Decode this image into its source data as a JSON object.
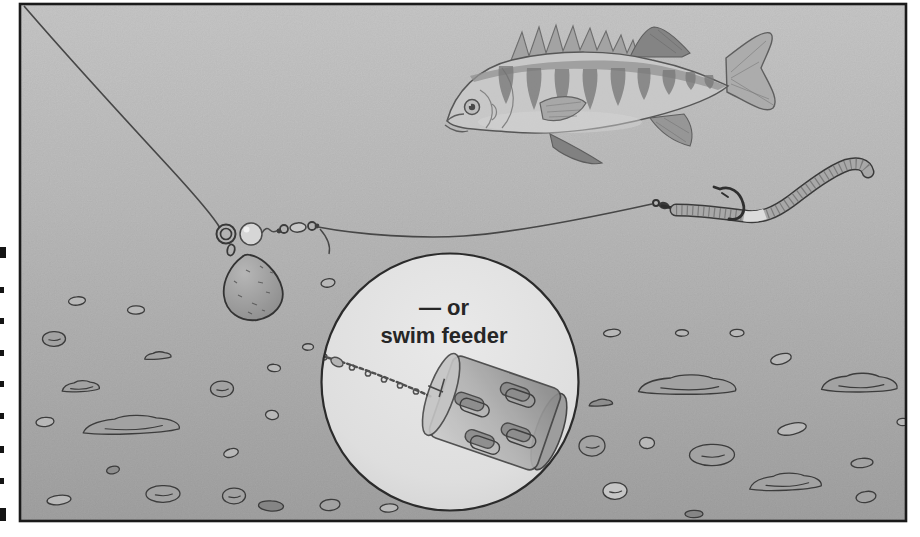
{
  "inset": {
    "label_line1": "— or",
    "label_line2": "swim feeder"
  },
  "scene": {
    "elements": [
      "fishing-line",
      "stop-ring",
      "bead",
      "barrel-swivel",
      "ledger-weight",
      "tag-end",
      "hook",
      "worm-bait",
      "perch-fish",
      "link-chain",
      "swim-feeder",
      "lake-bed-stones",
      "page-margin-marks"
    ]
  },
  "colors": {
    "page": "#ffffff",
    "background_top": "#cbcbcb",
    "background_mid": "#bdbdbd",
    "background_bottom": "#a5a5a5",
    "frame_border": "#1a1a1a",
    "inset_fill_center": "#e9e9e9",
    "inset_fill_edge": "#d0d0d0",
    "inset_stroke": "#2b2b2b",
    "text": "#262626",
    "line": "#474747",
    "stone_stroke": "#3c3c3c"
  },
  "margin_marks": [
    {
      "y": 247,
      "h": 11,
      "w": 6
    },
    {
      "y": 287,
      "h": 6,
      "w": 4
    },
    {
      "y": 318,
      "h": 6,
      "w": 4
    },
    {
      "y": 350,
      "h": 6,
      "w": 4
    },
    {
      "y": 381,
      "h": 6,
      "w": 4
    },
    {
      "y": 413,
      "h": 6,
      "w": 4
    },
    {
      "y": 446,
      "h": 7,
      "w": 4
    },
    {
      "y": 478,
      "h": 6,
      "w": 4
    },
    {
      "y": 508,
      "h": 13,
      "w": 6
    }
  ],
  "stones": [
    {
      "x": 77,
      "y": 301,
      "w": 17,
      "h": 9,
      "rot": -5,
      "shape": "blob",
      "fill": "#b8b8b8"
    },
    {
      "x": 136,
      "y": 310,
      "w": 17,
      "h": 9,
      "rot": 0,
      "shape": "blob",
      "fill": "#b8b8b8"
    },
    {
      "x": 54,
      "y": 339,
      "w": 23,
      "h": 16,
      "rot": 0,
      "shape": "blob",
      "fill": "#a2a2a2",
      "detail": true
    },
    {
      "x": 158,
      "y": 356,
      "w": 27,
      "h": 12,
      "rot": -4,
      "shape": "slab",
      "fill": "#a2a2a2"
    },
    {
      "x": 81,
      "y": 387,
      "w": 38,
      "h": 18,
      "rot": -3,
      "shape": "slab",
      "fill": "#a2a2a2",
      "detail": true
    },
    {
      "x": 222,
      "y": 389,
      "w": 23,
      "h": 17,
      "rot": 0,
      "shape": "blob",
      "fill": "#a2a2a2",
      "detail": true
    },
    {
      "x": 45,
      "y": 422,
      "w": 18,
      "h": 10,
      "rot": -5,
      "shape": "blob",
      "fill": "#b8b8b8"
    },
    {
      "x": 132,
      "y": 426,
      "w": 98,
      "h": 30,
      "rot": -2,
      "shape": "slab",
      "fill": "#a2a2a2",
      "detail": true
    },
    {
      "x": 272,
      "y": 415,
      "w": 13,
      "h": 10,
      "rot": 8,
      "shape": "blob",
      "fill": "#b8b8b8"
    },
    {
      "x": 308,
      "y": 347,
      "w": 11,
      "h": 7,
      "rot": 0,
      "shape": "blob",
      "fill": "#b8b8b8"
    },
    {
      "x": 328,
      "y": 283,
      "w": 14,
      "h": 9,
      "rot": -8,
      "shape": "blob",
      "fill": "#b8b8b8"
    },
    {
      "x": 274,
      "y": 368,
      "w": 13,
      "h": 8,
      "rot": 5,
      "shape": "blob",
      "fill": "#b8b8b8"
    },
    {
      "x": 113,
      "y": 470,
      "w": 13,
      "h": 8,
      "rot": -12,
      "shape": "blob",
      "fill": "#8e8e8e"
    },
    {
      "x": 163,
      "y": 494,
      "w": 34,
      "h": 18,
      "rot": 0,
      "shape": "blob",
      "fill": "#a2a2a2",
      "detail": true
    },
    {
      "x": 59,
      "y": 500,
      "w": 24,
      "h": 10,
      "rot": -6,
      "shape": "blob",
      "fill": "#b8b8b8"
    },
    {
      "x": 234,
      "y": 496,
      "w": 23,
      "h": 17,
      "rot": 0,
      "shape": "blob",
      "fill": "#a2a2a2",
      "detail": true
    },
    {
      "x": 271,
      "y": 506,
      "w": 25,
      "h": 11,
      "rot": 4,
      "shape": "blob",
      "fill": "#858585"
    },
    {
      "x": 330,
      "y": 505,
      "w": 20,
      "h": 12,
      "rot": -5,
      "shape": "blob",
      "fill": "#a2a2a2"
    },
    {
      "x": 231,
      "y": 453,
      "w": 15,
      "h": 9,
      "rot": -15,
      "shape": "blob",
      "fill": "#b8b8b8"
    },
    {
      "x": 389,
      "y": 508,
      "w": 18,
      "h": 9,
      "rot": -3,
      "shape": "blob",
      "fill": "#b8b8b8"
    },
    {
      "x": 612,
      "y": 333,
      "w": 17,
      "h": 8,
      "rot": -5,
      "shape": "blob",
      "fill": "#b8b8b8"
    },
    {
      "x": 682,
      "y": 333,
      "w": 13,
      "h": 7,
      "rot": 0,
      "shape": "blob",
      "fill": "#b8b8b8"
    },
    {
      "x": 737,
      "y": 333,
      "w": 14,
      "h": 8,
      "rot": 0,
      "shape": "blob",
      "fill": "#b8b8b8"
    },
    {
      "x": 781,
      "y": 359,
      "w": 21,
      "h": 11,
      "rot": -14,
      "shape": "blob",
      "fill": "#b8b8b8"
    },
    {
      "x": 688,
      "y": 386,
      "w": 99,
      "h": 32,
      "rot": 0,
      "shape": "slab",
      "fill": "#a2a2a2",
      "detail": true
    },
    {
      "x": 860,
      "y": 384,
      "w": 77,
      "h": 31,
      "rot": 0,
      "shape": "slab",
      "fill": "#a2a2a2",
      "detail": true
    },
    {
      "x": 601,
      "y": 403,
      "w": 24,
      "h": 11,
      "rot": -4,
      "shape": "slab",
      "fill": "#8e8e8e"
    },
    {
      "x": 792,
      "y": 429,
      "w": 29,
      "h": 12,
      "rot": -12,
      "shape": "blob",
      "fill": "#b8b8b8"
    },
    {
      "x": 592,
      "y": 446,
      "w": 26,
      "h": 22,
      "rot": 0,
      "shape": "blob",
      "fill": "#a2a2a2",
      "detail": true
    },
    {
      "x": 647,
      "y": 443,
      "w": 15,
      "h": 12,
      "rot": 5,
      "shape": "blob",
      "fill": "#b8b8b8"
    },
    {
      "x": 712,
      "y": 455,
      "w": 45,
      "h": 23,
      "rot": 0,
      "shape": "blob",
      "fill": "#a2a2a2",
      "detail": true
    },
    {
      "x": 786,
      "y": 483,
      "w": 73,
      "h": 28,
      "rot": -2,
      "shape": "slab",
      "fill": "#a2a2a2",
      "detail": true
    },
    {
      "x": 615,
      "y": 491,
      "w": 24,
      "h": 18,
      "rot": 0,
      "shape": "blob",
      "fill": "#c6c6c6",
      "detail": true
    },
    {
      "x": 866,
      "y": 497,
      "w": 20,
      "h": 12,
      "rot": -8,
      "shape": "blob",
      "fill": "#a2a2a2"
    },
    {
      "x": 694,
      "y": 514,
      "w": 18,
      "h": 8,
      "rot": 0,
      "shape": "blob",
      "fill": "#858585"
    },
    {
      "x": 862,
      "y": 463,
      "w": 22,
      "h": 10,
      "rot": -5,
      "shape": "blob",
      "fill": "#a2a2a2"
    },
    {
      "x": 903,
      "y": 422,
      "w": 12,
      "h": 8,
      "rot": 0,
      "shape": "blob",
      "fill": "#b8b8b8"
    }
  ]
}
